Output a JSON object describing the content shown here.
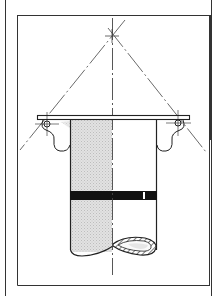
{
  "diagram": {
    "type": "technical-drawing",
    "colors": {
      "line": "#222222",
      "shading": "#d4d4d4",
      "band": "#111111",
      "background": "#ffffff"
    },
    "elements": [
      "outer-frame",
      "inner-frame",
      "vertical-centerline",
      "construction-lines-apex",
      "flange-plate",
      "left-pivot",
      "right-pivot",
      "cylinder-body",
      "shaded-half",
      "black-band",
      "elliptical-cut-opening"
    ]
  }
}
